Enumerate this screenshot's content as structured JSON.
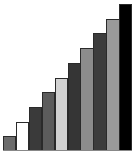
{
  "chart_data": {
    "type": "bar",
    "title": "",
    "xlabel": "",
    "ylabel": "",
    "categories": [
      "1",
      "2",
      "3",
      "4",
      "5",
      "6",
      "7",
      "8",
      "9",
      "10"
    ],
    "values": [
      1,
      2,
      3,
      4,
      5,
      6,
      7,
      8,
      9,
      10
    ],
    "ylim": [
      0,
      10
    ],
    "grid": false,
    "legend": null,
    "colors": [
      "#6b6b6b",
      "#ffffff",
      "#3a3a3a",
      "#5c5c5c",
      "#d2d2d2",
      "#353535",
      "#8c8c8c",
      "#3c3c3c",
      "#9a9a9a",
      "#000000"
    ]
  }
}
